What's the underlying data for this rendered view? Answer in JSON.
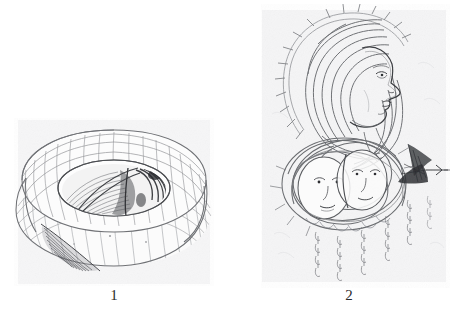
{
  "plate": {
    "background_color": "#ffffff",
    "width": 455,
    "height": 323,
    "medium": "pencil drawing scan",
    "figures": [
      {
        "number": "1",
        "caption": "1",
        "subject": "coiled spiral shell-like form with segmented outer coils and dense striated core",
        "ink_color": "#55565a",
        "paper_tint": "#f5f5f6"
      },
      {
        "number": "2",
        "caption": "2",
        "subject": "surrealist composition: profile face with flowing hair, two small faces below, dark triangular wing at right, dangling chains of hook marks",
        "ink_color": "#55565a",
        "paper_tint": "#f4f4f5"
      }
    ]
  },
  "figure1": {
    "label": "1",
    "title": "Figure 1",
    "elements": {
      "outer_coil": "segmented spiral band",
      "inner_rim": "elliptical inner opening",
      "core": "striated lamellar core",
      "tail": "hatched tapering tail at lower left"
    }
  },
  "figure2": {
    "label": "2",
    "title": "Figure 2",
    "elements": {
      "profile_head": "female profile facing right",
      "hair": "long flowing swirled hair",
      "halo_spikes": "radiating spike marks around head",
      "twin_faces": "two overlapping small faces",
      "wing": "dark filled triangular wing",
      "arrow_line": "horizontal line extending right from wing",
      "chains": "five descending chains of hook marks"
    }
  },
  "captions": {
    "figure_1": "1",
    "figure_2": "2"
  }
}
